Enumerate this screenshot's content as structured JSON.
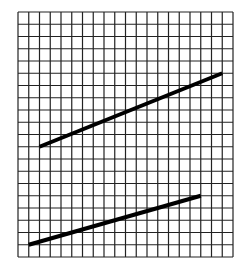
{
  "figure": {
    "type": "graph-paper-with-line-segments",
    "grid": {
      "columns": 20,
      "rows": 20,
      "origin_px": [
        18,
        257
      ],
      "cell_width_px": 10.75,
      "cell_height_px": 12.25,
      "line_color": "#222222",
      "background": "#ffffff"
    },
    "segments": [
      {
        "name": "upper-segment",
        "from": [
          2,
          9
        ],
        "to": [
          19,
          15
        ],
        "color": "#000000",
        "width": 4
      },
      {
        "name": "lower-segment",
        "from": [
          1,
          1
        ],
        "to": [
          17,
          5
        ],
        "color": "#000000",
        "width": 4
      }
    ]
  }
}
